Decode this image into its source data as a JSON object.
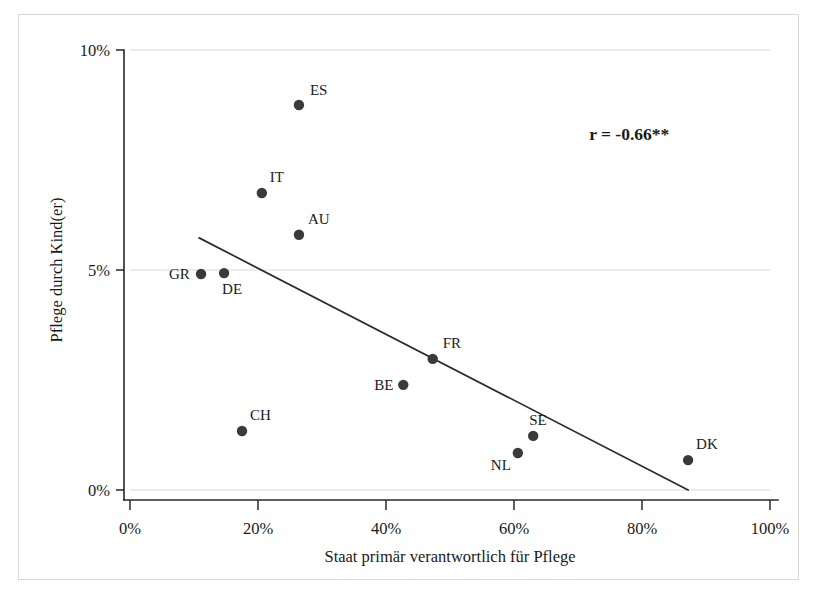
{
  "chart_data": {
    "type": "scatter",
    "title": "",
    "xlabel": "Staat primär verantwortlich für Pflege",
    "ylabel": "Pflege durch Kind(er)",
    "xlim": [
      0,
      100
    ],
    "ylim": [
      0,
      10
    ],
    "x_ticks": [
      "0%",
      "20%",
      "40%",
      "60%",
      "80%",
      "100%"
    ],
    "x_tick_values": [
      0,
      20,
      40,
      60,
      80,
      100
    ],
    "y_ticks": [
      "0%",
      "5%",
      "10%"
    ],
    "y_tick_values": [
      0,
      5,
      10
    ],
    "grid": "horizontal-gridlines-at-0-and-5",
    "legend": "none",
    "points": [
      {
        "label": "ES",
        "x": 26.4,
        "y": 8.75,
        "label_dx": 11,
        "label_dy": -10
      },
      {
        "label": "IT",
        "x": 20.6,
        "y": 6.75,
        "label_dx": 8,
        "label_dy": -11
      },
      {
        "label": "AU",
        "x": 26.4,
        "y": 5.8,
        "label_dx": 9,
        "label_dy": -11
      },
      {
        "label": "GR",
        "x": 11.1,
        "y": 4.91,
        "label_dx": -32,
        "label_dy": 5
      },
      {
        "label": "DE",
        "x": 14.7,
        "y": 4.93,
        "label_dx": -2,
        "label_dy": 21
      },
      {
        "label": "FR",
        "x": 47.3,
        "y": 2.98,
        "label_dx": 10,
        "label_dy": -11
      },
      {
        "label": "BE",
        "x": 42.7,
        "y": 2.39,
        "label_dx": -29,
        "label_dy": 5
      },
      {
        "label": "CH",
        "x": 17.5,
        "y": 1.34,
        "label_dx": 8,
        "label_dy": -11
      },
      {
        "label": "SE",
        "x": 63.0,
        "y": 1.23,
        "label_dx": -4,
        "label_dy": -11
      },
      {
        "label": "NL",
        "x": 60.6,
        "y": 0.84,
        "label_dx": -27,
        "label_dy": 17
      },
      {
        "label": "DK",
        "x": 87.2,
        "y": 0.68,
        "label_dx": 8,
        "label_dy": -11
      }
    ],
    "fit_line": {
      "x_start": 10.8,
      "y_start": 5.73,
      "x_end": 87.2,
      "y_end": 0.0
    },
    "annotations": [
      {
        "name": "correlation",
        "text": "r = -0.66**",
        "x": 78.0,
        "y": 7.95
      }
    ]
  },
  "colors": {
    "marker": "#3a3a3a",
    "axis": "#272727",
    "grid": "#dadada",
    "fit_line": "#2b2b2b",
    "background": "#ffffff"
  }
}
